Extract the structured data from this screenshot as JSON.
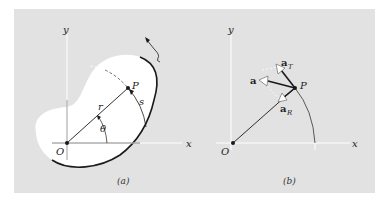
{
  "figure": {
    "panel_a": {
      "caption": "(a)",
      "axis_x": "x",
      "axis_y": "y",
      "origin": "O",
      "point": "P",
      "radius_label": "r",
      "angle_label": "θ",
      "arc_label": "s"
    },
    "panel_b": {
      "caption": "(b)",
      "axis_x": "x",
      "axis_y": "y",
      "origin": "O",
      "point": "P",
      "accel_label": "a",
      "tangential_label": "a",
      "tangential_sub": "T",
      "radial_label": "a",
      "radial_sub": "R"
    },
    "colors": {
      "background": "#e2e2e2",
      "body_fill": "#ffffff",
      "ink": "#1a1a1a",
      "axis": "#ffffff"
    }
  }
}
